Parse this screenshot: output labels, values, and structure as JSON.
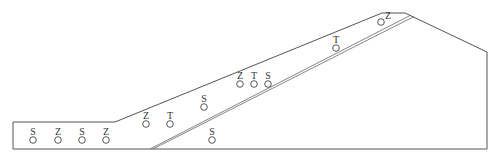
{
  "diagram": {
    "type": "cross-section profile with sample markers",
    "outline_points": [
      [
        13,
        122
      ],
      [
        115,
        122
      ],
      [
        382,
        13
      ],
      [
        405,
        13
      ],
      [
        487,
        52
      ],
      [
        487,
        149
      ],
      [
        13,
        149
      ],
      [
        13,
        122
      ]
    ],
    "inner_line": {
      "from": [
        150,
        149
      ],
      "to": [
        411,
        15
      ],
      "style": "double"
    },
    "markers": [
      {
        "label": "S",
        "x": 33,
        "y": 140
      },
      {
        "label": "Z",
        "x": 58,
        "y": 140
      },
      {
        "label": "S",
        "x": 82,
        "y": 140
      },
      {
        "label": "Z",
        "x": 106,
        "y": 140
      },
      {
        "label": "Z",
        "x": 146,
        "y": 124
      },
      {
        "label": "T",
        "x": 170,
        "y": 124
      },
      {
        "label": "S",
        "x": 204,
        "y": 107
      },
      {
        "label": "S",
        "x": 212,
        "y": 140
      },
      {
        "label": "Z",
        "x": 240,
        "y": 84
      },
      {
        "label": "T",
        "x": 254,
        "y": 84
      },
      {
        "label": "S",
        "x": 268,
        "y": 84
      },
      {
        "label": "T",
        "x": 336,
        "y": 48
      },
      {
        "label": "Z",
        "x": 381,
        "y": 22,
        "label_offset": [
          7,
          -3
        ]
      }
    ]
  }
}
